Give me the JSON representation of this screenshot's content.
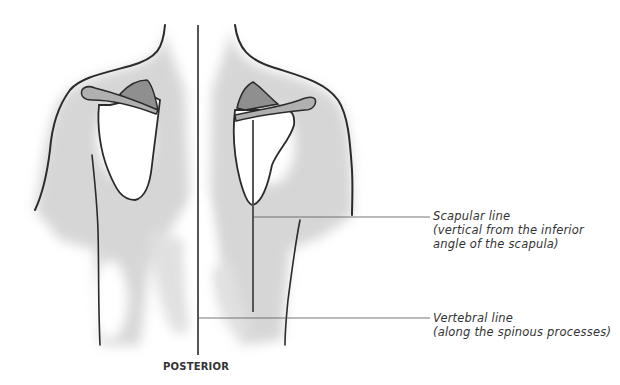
{
  "figure": {
    "view": "POSTERIOR"
  },
  "labels": {
    "scapular": {
      "title": "Scapular line",
      "line2": "(vertical from the inferior",
      "line3": "angle of the scapula)"
    },
    "vertebral": {
      "title": "Vertebral line",
      "line2": "(along the spinous processes)"
    }
  },
  "caption": "POSTERIOR",
  "colors": {
    "outline": "#2a2a2a",
    "shading": "#9a9a9a",
    "reference_line": "#555555",
    "text": "#333333"
  }
}
